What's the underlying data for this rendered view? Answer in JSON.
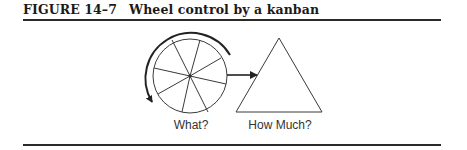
{
  "caption": {
    "label": "FIGURE 14–7",
    "title": "Wheel control by a kanban"
  },
  "diagram": {
    "wheel_label": "What?",
    "triangle_label": "How Much?",
    "stroke_color": "#3a3a3a"
  }
}
